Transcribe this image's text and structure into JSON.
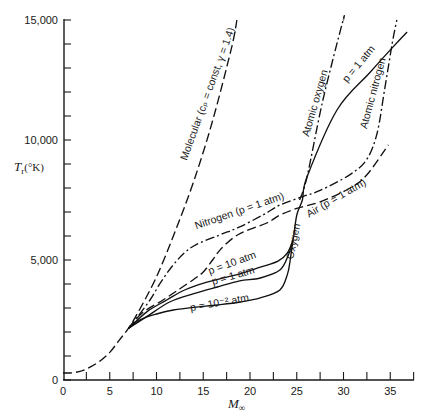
{
  "chart_data": {
    "type": "line",
    "title": "",
    "xlabel": "M∞",
    "ylabel": "Tr(°K)",
    "axis_labels": {
      "x_base": "M",
      "x_sub": "∞",
      "y_base": "T",
      "y_sub": "r",
      "y_unit": "(°K)"
    },
    "xlim": [
      0,
      37.5
    ],
    "ylim": [
      0,
      15000
    ],
    "grid": false,
    "legend": "none (curves labeled inline)",
    "xticks": [
      0,
      5,
      10,
      15,
      20,
      25,
      30,
      35
    ],
    "xtick_labels": [
      "0",
      "5",
      "10",
      "15",
      "20",
      "25",
      "30",
      "35"
    ],
    "x_minor_step": 2.5,
    "yticks": [
      0,
      5000,
      10000,
      15000
    ],
    "ytick_labels": [
      "0",
      "5,000",
      "10,000",
      "15,000"
    ],
    "y_minor_step": 1000,
    "series": [
      {
        "name": "Molecular (cp = const, γ = 1.4)",
        "style": "dash",
        "points": [
          [
            0,
            290
          ],
          [
            1,
            300
          ],
          [
            2,
            380
          ],
          [
            3,
            560
          ],
          [
            4,
            800
          ],
          [
            5,
            1150
          ],
          [
            6,
            1650
          ],
          [
            7,
            2150
          ],
          [
            8,
            2800
          ],
          [
            10,
            4300
          ],
          [
            12,
            6200
          ],
          [
            14,
            8300
          ],
          [
            16,
            10800
          ],
          [
            18,
            13800
          ],
          [
            18.6,
            15000
          ]
        ]
      },
      {
        "name": "Nitrogen (p = 1 atm) / Atomic nitrogen",
        "style": "dashdot",
        "points": [
          [
            7,
            2150
          ],
          [
            8,
            2650
          ],
          [
            9.3,
            3333
          ],
          [
            10.5,
            4100
          ],
          [
            11.8,
            4800
          ],
          [
            13,
            5300
          ],
          [
            14.3,
            5650
          ],
          [
            16.8,
            6050
          ],
          [
            18.9,
            6380
          ],
          [
            21.5,
            6900
          ],
          [
            23.2,
            7290
          ],
          [
            25.7,
            7650
          ],
          [
            27.5,
            7900
          ],
          [
            30.7,
            8560
          ],
          [
            32.5,
            9200
          ],
          [
            33.6,
            10300
          ],
          [
            34.4,
            12100
          ],
          [
            35.2,
            14000
          ],
          [
            35.7,
            15000
          ]
        ]
      },
      {
        "name": "Air (p = 1 atm)",
        "style": "dash",
        "points": [
          [
            7,
            2150
          ],
          [
            8.5,
            2800
          ],
          [
            10.7,
            3333
          ],
          [
            12.5,
            3800
          ],
          [
            14,
            4200
          ],
          [
            15,
            4500
          ],
          [
            16,
            5000
          ],
          [
            16.8,
            5420
          ],
          [
            18.2,
            5920
          ],
          [
            19.5,
            6200
          ],
          [
            21.8,
            6540
          ],
          [
            23.2,
            6870
          ],
          [
            25,
            7150
          ],
          [
            27.5,
            7420
          ],
          [
            30.7,
            8000
          ],
          [
            32.5,
            8550
          ],
          [
            34.8,
            9800
          ]
        ]
      },
      {
        "name": "Oxygen p = 10 atm",
        "style": "solid",
        "points": [
          [
            7,
            2150
          ],
          [
            9,
            2850
          ],
          [
            11.1,
            3333
          ],
          [
            13,
            3750
          ],
          [
            15.4,
            4080
          ],
          [
            18.9,
            4420
          ],
          [
            21.1,
            4700
          ],
          [
            23,
            4950
          ],
          [
            24,
            5300
          ],
          [
            24.6,
            5830
          ]
        ]
      },
      {
        "name": "Oxygen p = 1 atm",
        "style": "solid",
        "points": [
          [
            7,
            2150
          ],
          [
            9,
            2650
          ],
          [
            11.4,
            3250
          ],
          [
            14,
            3600
          ],
          [
            16.5,
            3875
          ],
          [
            18.9,
            4130
          ],
          [
            21.1,
            4250
          ],
          [
            23.2,
            4580
          ],
          [
            24.1,
            5200
          ],
          [
            24.6,
            5830
          ],
          [
            25,
            6875
          ],
          [
            25.6,
            7500
          ],
          [
            26.1,
            8458
          ],
          [
            29.3,
            11250
          ],
          [
            32.8,
            12800
          ],
          [
            35.3,
            13880
          ],
          [
            36.8,
            14500
          ]
        ]
      },
      {
        "name": "Oxygen p = 10^-2 atm",
        "style": "solid",
        "points": [
          [
            7,
            2150
          ],
          [
            8.2,
            2500
          ],
          [
            10,
            2750
          ],
          [
            11.8,
            2917
          ],
          [
            14,
            3030
          ],
          [
            16.5,
            3125
          ],
          [
            19,
            3250
          ],
          [
            21.1,
            3420
          ],
          [
            23.2,
            3750
          ],
          [
            24,
            4400
          ],
          [
            24.3,
            5000
          ],
          [
            24.6,
            5830
          ]
        ]
      },
      {
        "name": "Atomic oxygen",
        "style": "dashdot",
        "points": [
          [
            25.3,
            7500
          ],
          [
            26.1,
            8458
          ],
          [
            27.8,
            11667
          ],
          [
            29.9,
            14917
          ],
          [
            30,
            15000
          ]
        ]
      }
    ],
    "annotations": [
      {
        "text": "Molecular (cₚ = const, γ = 1.4)",
        "x": 15.8,
        "y": 11875,
        "rotate": -70
      },
      {
        "text": "Atomic oxygen",
        "x": 27.3,
        "y": 11500,
        "rotate": -74
      },
      {
        "text": "p = 1 atm",
        "x": 31.9,
        "y": 13083,
        "rotate": -50
      },
      {
        "text": "Atomic nitrogen",
        "x": 33.5,
        "y": 11917,
        "rotate": -75
      },
      {
        "text": "Nitrogen (p = 1 atm)",
        "x": 19.0,
        "y": 6917,
        "rotate": -19
      },
      {
        "text": "Air (p = 1 atm)",
        "x": 29.4,
        "y": 7458,
        "rotate": -30
      },
      {
        "text": "Oxygen",
        "x": 25.0,
        "y": 5750,
        "rotate": -78
      },
      {
        "text": "p = 10 atm",
        "x": 18.2,
        "y": 4750,
        "rotate": -20
      },
      {
        "text": "p = 1 atm",
        "x": 18.3,
        "y": 4208,
        "rotate": -16
      },
      {
        "text": "p = 10⁻² atm",
        "x": 16.8,
        "y": 3083,
        "rotate": -10
      }
    ]
  }
}
